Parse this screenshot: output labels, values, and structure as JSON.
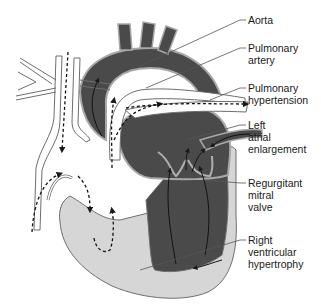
{
  "diagram": {
    "colors": {
      "background": "#ffffff",
      "left_heart_dark": "#4a4a4a",
      "right_heart_light": "#d6d6d6",
      "vessel_outline": "#6e6e6e",
      "vessel_fill": "#ffffff",
      "leader_line": "#555555",
      "text": "#1a1a1a"
    },
    "labels": [
      {
        "id": "aorta",
        "lines": [
          "Aorta"
        ]
      },
      {
        "id": "pulmonary-artery",
        "lines": [
          "Pulmonary",
          "artery"
        ]
      },
      {
        "id": "pulmonary-hypertension",
        "lines": [
          "Pulmonary",
          "hypertension"
        ]
      },
      {
        "id": "left-atrial-enlargement",
        "lines": [
          "Left",
          "atrial",
          "enlargement"
        ]
      },
      {
        "id": "regurgitant-mitral-valve",
        "lines": [
          "Regurgitant",
          "mitral",
          "valve"
        ]
      },
      {
        "id": "right-ventricular-hypertrophy",
        "lines": [
          "Right",
          "ventricular",
          "hypertrophy"
        ]
      }
    ]
  }
}
